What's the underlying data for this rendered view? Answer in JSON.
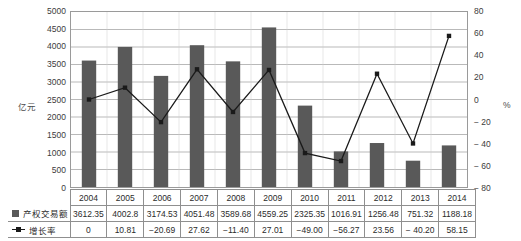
{
  "chart_data": {
    "type": "bar",
    "title": "",
    "categories": [
      "2004",
      "2005",
      "2006",
      "2007",
      "2008",
      "2009",
      "2010",
      "2011",
      "2012",
      "2013",
      "2014"
    ],
    "series": [
      {
        "name": "产权交易额",
        "type": "bar",
        "axis": "left",
        "values": [
          3612.35,
          4002.8,
          3174.53,
          4051.48,
          3589.68,
          4559.25,
          2325.35,
          1016.91,
          1256.48,
          751.32,
          1188.18
        ],
        "labels": [
          "3612.35",
          "4002.8",
          "3174.53",
          "4051.48",
          "3589.68",
          "4559.25",
          "2325.35",
          "1016.91",
          "1256.48",
          "751.32",
          "1188.18"
        ],
        "color": "#595959"
      },
      {
        "name": "增长率",
        "type": "line",
        "axis": "right",
        "values": [
          0,
          10.81,
          -20.69,
          27.62,
          -11.4,
          27.01,
          -49.0,
          -56.27,
          23.56,
          -40.2,
          58.15
        ],
        "labels": [
          "0",
          "10.81",
          "−20.69",
          "27.62",
          "−11.40",
          "27.01",
          "−49.00",
          "−56.27",
          "23.56",
          "− 40.20",
          "58.15"
        ],
        "color": "#1a1a1a"
      }
    ],
    "xlabel": "",
    "ylabel_left": "亿元",
    "ylabel_right": "%",
    "ylim_left": [
      0,
      5000
    ],
    "ylim_right": [
      -80,
      80
    ],
    "yticks_left": [
      "5000",
      "4500",
      "4000",
      "3500",
      "3000",
      "2500",
      "2000",
      "1500",
      "1000",
      "500",
      "0"
    ],
    "yticks_right": [
      "80",
      "60",
      "40",
      "20",
      "0",
      "− 20",
      "− 40",
      "− 60",
      "− 80"
    ],
    "grid": true,
    "legend_position": "table-left"
  },
  "table": {
    "header_row": [
      "2004",
      "2005",
      "2006",
      "2007",
      "2008",
      "2009",
      "2010",
      "2011",
      "2012",
      "2013",
      "2014"
    ],
    "rows": [
      {
        "legend": "产权交易额",
        "marker": "bar-swatch",
        "values": [
          "3612.35",
          "4002.8",
          "3174.53",
          "4051.48",
          "3589.68",
          "4559.25",
          "2325.35",
          "1016.91",
          "1256.48",
          "751.32",
          "1188.18"
        ]
      },
      {
        "legend": "增长率",
        "marker": "line-swatch",
        "values": [
          "0",
          "10.81",
          "−20.69",
          "27.62",
          "−11.40",
          "27.01",
          "−49.00",
          "−56.27",
          "23.56",
          "− 40.20",
          "58.15"
        ]
      }
    ]
  },
  "colors": {
    "bar": "#595959",
    "line": "#1a1a1a",
    "grid": "#9a9a9a",
    "axis": "#9a9a9a",
    "text": "#2b2b2b"
  }
}
